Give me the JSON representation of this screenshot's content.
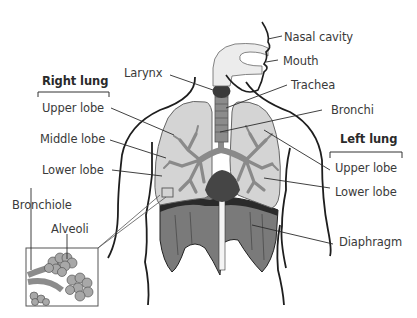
{
  "diagram": {
    "groups": {
      "right_lung": {
        "heading": "Right lung",
        "lobes": [
          "Upper lobe",
          "Middle lobe",
          "Lower lobe"
        ]
      },
      "left_lung": {
        "heading": "Left lung",
        "lobes": [
          "Upper lobe",
          "Lower lobe"
        ]
      }
    },
    "labels": {
      "nasal_cavity": "Nasal cavity",
      "mouth": "Mouth",
      "larynx": "Larynx",
      "trachea": "Trachea",
      "bronchi": "Bronchi",
      "bronchiole": "Bronchiole",
      "alveoli": "Alveoli",
      "diaphragm": "Diaphragm"
    },
    "colors": {
      "outline": "#1e1e1e",
      "lung_fill": "#d6d6d6",
      "bronchi_fill": "#8e8e8e",
      "larynx_fill": "#3d3d3d",
      "heart_fill": "#4a4a4a",
      "diaphragm_fill": "#6e6e6e",
      "airway_fill": "#ececec",
      "leader_line": "#2b2b2b"
    }
  }
}
